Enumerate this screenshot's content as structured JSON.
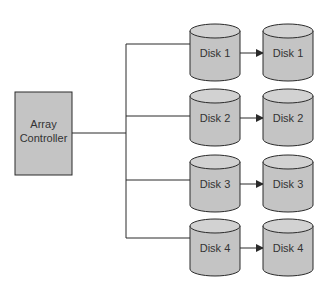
{
  "diagram": {
    "title": "",
    "controller": {
      "label_lines": [
        "Array",
        "Controller"
      ]
    },
    "colors": {
      "fill": "#c4c4c4",
      "top_fill": "#d2d2d2",
      "stroke": "#2a2a2a",
      "line": "#2a2a2a",
      "background": "#ffffff"
    },
    "pairs": [
      {
        "source": "Disk 1",
        "mirror": "Disk 1"
      },
      {
        "source": "Disk 2",
        "mirror": "Disk 2"
      },
      {
        "source": "Disk 3",
        "mirror": "Disk 3"
      },
      {
        "source": "Disk 4",
        "mirror": "Disk 4"
      }
    ]
  }
}
